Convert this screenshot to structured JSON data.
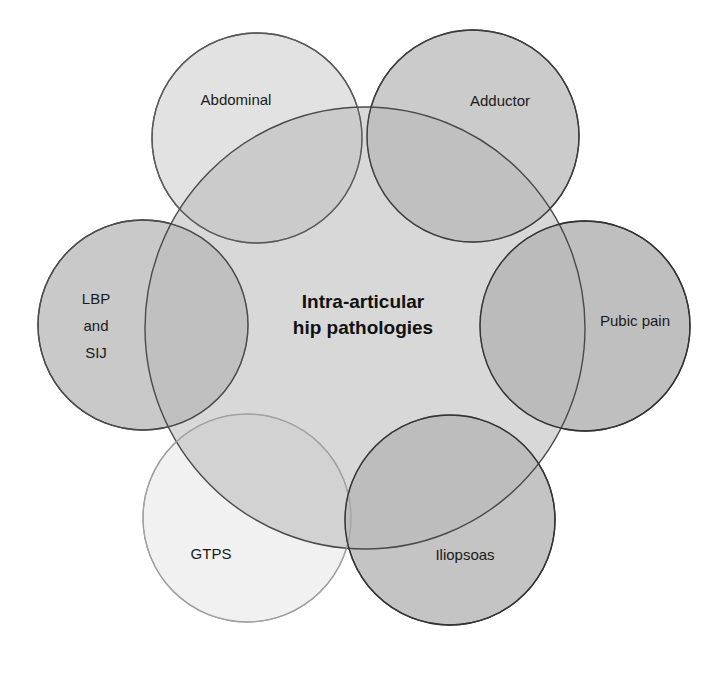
{
  "diagram": {
    "title": "Intra-articular hip pathologies",
    "center": {
      "label_line1": "Intra-articular",
      "label_line2": "hip pathologies",
      "fill": "#d4d4d4",
      "stroke": "#4a4a4a"
    },
    "satellites": [
      {
        "id": "abdominal",
        "label_line1": "Abdominal",
        "fill": "#e0e0e0",
        "stroke": "#5a5a5a"
      },
      {
        "id": "adductor",
        "label_line1": "Adductor",
        "fill": "#c9c9c9",
        "stroke": "#3e3e3e"
      },
      {
        "id": "lbp-sij",
        "label_line1": "LBP",
        "label_line2": "and",
        "label_line3": "SIJ",
        "fill": "#c8c8c8",
        "stroke": "#4a4a4a"
      },
      {
        "id": "pubic-pain",
        "label_line1": "Pubic pain",
        "fill": "#bdbdbd",
        "stroke": "#333333"
      },
      {
        "id": "gtps",
        "label_line1": "GTPS",
        "fill": "#f0f0f0",
        "stroke": "#9a9a9a"
      },
      {
        "id": "iliopsoas",
        "label_line1": "Iliopsoas",
        "fill": "#c2c2c2",
        "stroke": "#333333"
      }
    ]
  }
}
